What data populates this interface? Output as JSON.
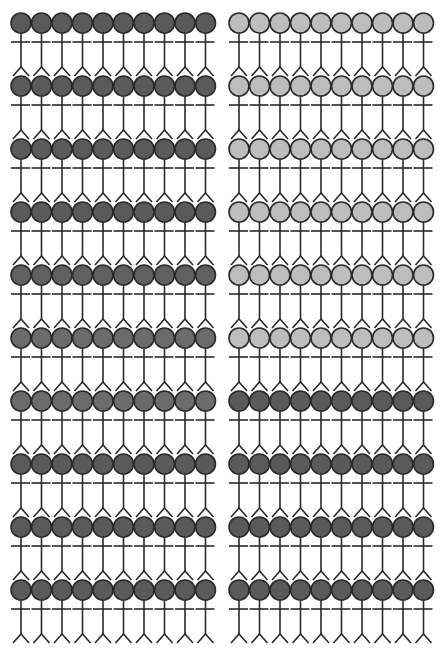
{
  "chart_data": {
    "type": "icon-array",
    "title": "",
    "icon": "stick-figure",
    "total_icons": 200,
    "groups": [
      {
        "name": "left-group",
        "columns": 10,
        "rows": 10,
        "row_colors": [
          "#5a5a5a",
          "#5a5a5a",
          "#5a5a5a",
          "#5a5a5a",
          "#606060",
          "#6b6b6b",
          "#6b6b6b",
          "#5a5a5a",
          "#5a5a5a",
          "#5a5a5a"
        ],
        "counts": {
          "dark": 100,
          "light": 0
        }
      },
      {
        "name": "right-group",
        "columns": 10,
        "rows": 10,
        "row_colors": [
          "#bdbdbd",
          "#bdbdbd",
          "#bdbdbd",
          "#bdbdbd",
          "#bdbdbd",
          "#bdbdbd",
          "#5a5a5a",
          "#5a5a5a",
          "#5a5a5a",
          "#5a5a5a"
        ],
        "counts": {
          "dark": 40,
          "light": 60
        }
      }
    ],
    "series": [
      {
        "name": "dark",
        "color": "#5a5a5a",
        "values": [
          100,
          40
        ]
      },
      {
        "name": "light",
        "color": "#bdbdbd",
        "values": [
          0,
          60
        ]
      }
    ],
    "categories": [
      "left group",
      "right group"
    ],
    "legend": []
  },
  "layout": {
    "left_group_x0": 21,
    "right_group_x0": 239,
    "col_pitch": 20.5,
    "row_y0": 23,
    "row_pitch": 63,
    "head_radius": 10,
    "stroke_color": "#2a2a2a"
  }
}
